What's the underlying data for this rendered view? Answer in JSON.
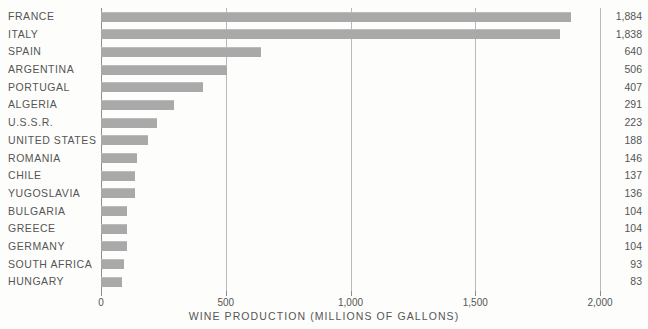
{
  "chart_data": {
    "type": "bar",
    "orientation": "horizontal",
    "title": "",
    "xlabel": "WINE PRODUCTION (MILLIONS OF GALLONS)",
    "ylabel": "",
    "xlim": [
      0,
      2000
    ],
    "xticks": [
      0,
      500,
      1000,
      1500,
      2000
    ],
    "xtick_labels": [
      "0",
      "500",
      "1,000",
      "1,500",
      "2,000"
    ],
    "grid": true,
    "grid_axis": "x",
    "legend": false,
    "bar_color": "#a9a9a9",
    "categories": [
      "FRANCE",
      "ITALY",
      "SPAIN",
      "ARGENTINA",
      "PORTUGAL",
      "ALGERIA",
      "U.S.S.R.",
      "UNITED STATES",
      "ROMANIA",
      "CHILE",
      "YUGOSLAVIA",
      "BULGARIA",
      "GREECE",
      "GERMANY",
      "SOUTH AFRICA",
      "HUNGARY"
    ],
    "values": [
      1884,
      1838,
      640,
      506,
      407,
      291,
      223,
      188,
      146,
      137,
      136,
      104,
      104,
      104,
      93,
      83
    ],
    "value_labels": [
      "1,884",
      "1,838",
      "640",
      "506",
      "407",
      "291",
      "223",
      "188",
      "146",
      "137",
      "136",
      "104",
      "104",
      "104",
      "93",
      "83"
    ]
  },
  "colors": {
    "bar": "#a9a9a9",
    "gridline": "#b9b9b9",
    "axis": "#8f8f8f",
    "text": "#555555",
    "background": "#fdfdfc"
  }
}
